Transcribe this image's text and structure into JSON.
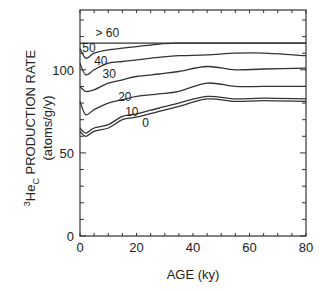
{
  "chart_data": {
    "type": "line",
    "title": "",
    "xlabel": "AGE (ky)",
    "ylabel": "3HeC PRODUCTION RATE (atoms/g/y)",
    "ylabel_line1_sup": "3",
    "ylabel_line1_main": "He",
    "ylabel_line1_sub": "C",
    "ylabel_line1_rest": " PRODUCTION RATE",
    "ylabel_line2": "(atoms/g/y)",
    "xlim": [
      0,
      80
    ],
    "ylim": [
      0,
      136
    ],
    "xticks": [
      0,
      20,
      40,
      60,
      80
    ],
    "yticks": [
      0,
      50,
      100
    ],
    "grid": false,
    "legend": "inline curve labels (latitude bands)",
    "x": [
      0,
      2,
      5,
      10,
      15,
      20,
      28,
      35,
      45,
      55,
      65,
      80
    ],
    "series": [
      {
        "name": ">60",
        "values": [
          116,
          116,
          116,
          116,
          116,
          116,
          116,
          116,
          116,
          116,
          116,
          116
        ]
      },
      {
        "name": "50",
        "values": [
          113,
          107,
          110,
          112,
          113,
          114,
          115.5,
          116,
          116,
          116,
          116,
          116
        ]
      },
      {
        "name": "40",
        "values": [
          104,
          97,
          100,
          104,
          105,
          106,
          107.5,
          108.5,
          109,
          110,
          110,
          108.5
        ]
      },
      {
        "name": "30",
        "values": [
          90,
          87,
          88,
          92,
          94,
          96,
          97.5,
          99,
          102,
          100,
          100.5,
          101
        ]
      },
      {
        "name": "20",
        "values": [
          81,
          73,
          76,
          80,
          82,
          84,
          85.5,
          87,
          92,
          90,
          90,
          90
        ]
      },
      {
        "name": "10",
        "values": [
          65,
          62,
          65,
          67,
          72,
          73.5,
          77,
          80,
          84,
          82.5,
          83,
          82.5
        ]
      },
      {
        "name": "0",
        "values": [
          63,
          60,
          63,
          65,
          70,
          71.5,
          75,
          78,
          82.5,
          81,
          81.5,
          81
        ]
      }
    ],
    "curve_labels": [
      {
        "text": "> 60",
        "x": 5.5,
        "y": 119.5
      },
      {
        "text": "50",
        "x": 0.8,
        "y": 111
      },
      {
        "text": "40",
        "x": 5,
        "y": 103
      },
      {
        "text": "30",
        "x": 8,
        "y": 95
      },
      {
        "text": "20",
        "x": 13.5,
        "y": 81
      },
      {
        "text": "10",
        "x": 16,
        "y": 72.5
      },
      {
        "text": "0",
        "x": 22,
        "y": 65.5
      }
    ]
  }
}
